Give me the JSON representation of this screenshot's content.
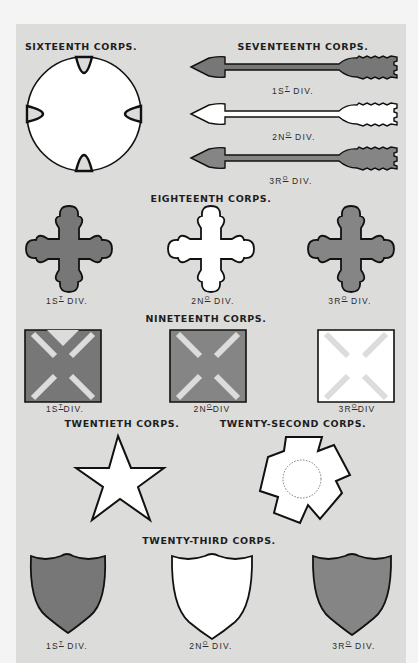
{
  "plate": {
    "background_color": "#dcdcdb",
    "badge_colors": {
      "red_1st": "#777777",
      "white_2nd": "#ffffff",
      "blue_3rd": "#858585",
      "outline": "#111111"
    }
  },
  "corps": [
    {
      "id": "sixteenth",
      "title": "SIXTEENTH CORPS.",
      "badge": "circle-with-crescent-cutouts",
      "divisions": []
    },
    {
      "id": "seventeenth",
      "title": "SEVENTEENTH CORPS.",
      "badge": "arrow",
      "divisions": [
        {
          "label": "1ST DIV."
        },
        {
          "label": "2ND DIV."
        },
        {
          "label": "3RD DIV."
        }
      ]
    },
    {
      "id": "eighteenth",
      "title": "EIGHTEENTH CORPS.",
      "badge": "cross-trefoil",
      "divisions": [
        {
          "label": "1ST DIV."
        },
        {
          "label": "2ND DIV."
        },
        {
          "label": "3RD DIV."
        }
      ]
    },
    {
      "id": "nineteenth",
      "title": "NINETEENTH CORPS.",
      "badge": "fan-leaved-cross",
      "divisions": [
        {
          "label": "1ST DIV."
        },
        {
          "label": "2ND DIV"
        },
        {
          "label": "3RD DIV"
        }
      ]
    },
    {
      "id": "twentieth",
      "title": "TWENTIETH CORPS.",
      "badge": "star",
      "divisions": []
    },
    {
      "id": "twenty-second",
      "title": "TWENTY-SECOND CORPS.",
      "badge": "pentagon-cross-with-circle",
      "divisions": []
    },
    {
      "id": "twenty-third",
      "title": "TWENTY-THIRD CORPS.",
      "badge": "shield",
      "divisions": [
        {
          "label": "1ST DIV."
        },
        {
          "label": "2ND DIV."
        },
        {
          "label": "3RD DIV."
        }
      ]
    }
  ],
  "div_parts": {
    "d1": {
      "num": "1S",
      "sup": "T",
      "rest": " DIV."
    },
    "d2": {
      "num": "2N",
      "sup": "O",
      "rest": " DIV."
    },
    "d3": {
      "num": "3R",
      "sup": "O",
      "rest": " DIV."
    },
    "d2b": {
      "num": "2N",
      "sup": "O",
      "rest": "DIV"
    },
    "d3b": {
      "num": "3R",
      "sup": "O",
      "rest": "DIV"
    },
    "d1b": {
      "num": "1S",
      "sup": "T",
      "rest": "DIV."
    }
  }
}
